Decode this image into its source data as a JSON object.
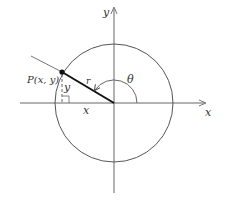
{
  "diagram": {
    "type": "polar-coordinates-unit-circle",
    "labels": {
      "y_axis": "y",
      "x_axis": "x",
      "point": "P(x, y)",
      "radius": "r",
      "angle": "θ",
      "horizontal_leg": "x",
      "vertical_leg": "y"
    },
    "colors": {
      "stroke": "#555555",
      "radius_line": "#111111",
      "text": "#333333",
      "background": "#ffffff"
    }
  }
}
